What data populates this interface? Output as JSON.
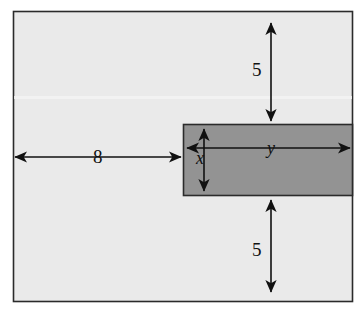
{
  "figure": {
    "type": "geometry-diagram",
    "colors": {
      "outer_fill": "#eaeaea",
      "inner_fill": "#939393",
      "stroke": "#2b2b2b",
      "label": "#111111",
      "page_background": "#ffffff"
    },
    "outer_rect": {
      "name": "outer-region",
      "x": 13,
      "y": 11,
      "width": 340,
      "height": 291
    },
    "inner_rect": {
      "name": "shaded-rect",
      "x": 183,
      "y": 124,
      "width": 170,
      "height": 72
    },
    "labels": {
      "top_gap": "5",
      "bottom_gap": "5",
      "left_gap": "8",
      "inner_width": "y",
      "inner_height": "x"
    },
    "dimension_lines": [
      {
        "name": "top-5-dimension",
        "orientation": "vertical",
        "x": 271,
        "from": 22,
        "to": 122,
        "label": "5"
      },
      {
        "name": "bottom-5-dimension",
        "orientation": "vertical",
        "x": 271,
        "from": 199,
        "to": 293,
        "label": "5"
      },
      {
        "name": "left-8-dimension",
        "orientation": "horizontal",
        "y": 157,
        "from": 14,
        "to": 182,
        "label": "8"
      },
      {
        "name": "y-dimension",
        "orientation": "horizontal",
        "y": 148,
        "from": 186,
        "to": 351,
        "label": "y"
      },
      {
        "name": "x-dimension",
        "orientation": "vertical",
        "x": 204,
        "from": 128,
        "to": 192,
        "label": "x"
      }
    ]
  }
}
